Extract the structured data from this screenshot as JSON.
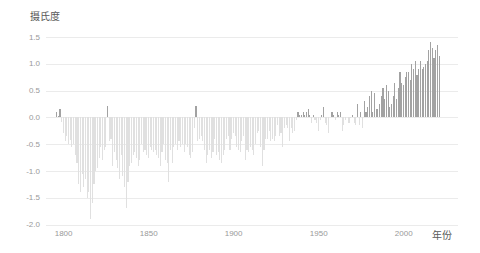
{
  "title": "摄氏度",
  "x_axis_name": "年份",
  "colors": {
    "background": "#ffffff",
    "positive_bar": "#a2a2a2",
    "negative_bar": "#e0e0e0",
    "gridline": "#ebebeb",
    "tick_label": "#999999",
    "axis_title": "#595959"
  },
  "y_axis": {
    "labels": [
      "1.5",
      "1.0",
      "0.5",
      "0.0",
      "-0.5",
      "-1.0",
      "-1.5",
      "-2.0"
    ]
  },
  "chart_data": {
    "type": "bar",
    "title": "摄氏度",
    "xlabel": "年份",
    "ylabel": "摄氏度",
    "legend": false,
    "grid": true,
    "ylim": [
      -2.0,
      1.5
    ],
    "yticks": [
      1.5,
      1.0,
      0.5,
      0.0,
      -0.5,
      -1.0,
      -1.5,
      -2.0
    ],
    "xticks": [
      1800,
      1850,
      1900,
      1950,
      2000
    ],
    "year_start": 1796,
    "year_end": 2021,
    "values": [
      0.11,
      0.03,
      0.16,
      -0.08,
      -0.3,
      -0.45,
      -0.35,
      -0.5,
      -0.42,
      -0.55,
      -0.5,
      -0.7,
      -0.85,
      -1.25,
      -1.4,
      -1.05,
      -1.3,
      -1.15,
      -1.5,
      -1.4,
      -1.9,
      -1.6,
      -1.25,
      -1.0,
      -0.95,
      -0.75,
      -0.55,
      -0.8,
      -0.6,
      -0.55,
      0.22,
      -0.45,
      -0.4,
      -0.9,
      -0.65,
      -0.8,
      -0.95,
      -1.15,
      -0.7,
      -1.1,
      -1.3,
      -1.7,
      -1.2,
      -0.9,
      -0.85,
      -0.7,
      -0.65,
      -0.75,
      -0.9,
      -0.8,
      -0.5,
      -0.65,
      -0.6,
      -0.7,
      -0.75,
      -0.55,
      -0.6,
      -0.65,
      -0.6,
      -0.7,
      -0.75,
      -0.9,
      -0.65,
      -0.5,
      -0.8,
      -0.85,
      -1.2,
      -0.6,
      -0.85,
      -0.55,
      -0.5,
      -0.6,
      -0.45,
      -0.55,
      -0.5,
      -0.65,
      -0.5,
      -0.55,
      -0.7,
      -0.75,
      -0.65,
      -0.2,
      0.22,
      -0.45,
      -0.4,
      -0.35,
      -0.45,
      -0.6,
      -0.85,
      -0.7,
      -0.6,
      -0.75,
      -0.65,
      -0.4,
      -0.7,
      -0.65,
      -0.8,
      -0.85,
      -0.7,
      -0.6,
      -0.4,
      -0.35,
      -0.6,
      -0.4,
      -0.3,
      -0.35,
      -0.55,
      -0.6,
      -0.65,
      -0.45,
      -0.35,
      -0.8,
      -0.6,
      -0.65,
      -0.55,
      -0.6,
      -0.7,
      -0.5,
      -0.3,
      -0.25,
      -0.55,
      -0.9,
      -0.6,
      -0.4,
      -0.4,
      -0.25,
      -0.45,
      -0.4,
      -0.45,
      -0.35,
      -0.15,
      -0.35,
      -0.3,
      -0.55,
      -0.2,
      -0.15,
      -0.2,
      -0.45,
      -0.2,
      -0.3,
      -0.25,
      -0.05,
      0.1,
      0.05,
      0.05,
      0.1,
      0.05,
      0.1,
      0.15,
      0.05,
      -0.1,
      0.05,
      -0.05,
      -0.1,
      -0.25,
      -0.05,
      0.05,
      0.2,
      -0.1,
      -0.15,
      -0.3,
      0.0,
      0.1,
      0.05,
      -0.05,
      0.1,
      0.05,
      0.1,
      -0.25,
      -0.15,
      -0.05,
      0.0,
      -0.1,
      -0.02,
      0.05,
      -0.1,
      -0.15,
      0.25,
      -0.15,
      0.1,
      -0.2,
      0.3,
      0.1,
      0.2,
      0.4,
      0.5,
      0.1,
      0.45,
      0.15,
      0.15,
      0.25,
      0.4,
      0.55,
      0.35,
      0.6,
      0.5,
      0.2,
      0.25,
      0.4,
      0.65,
      0.35,
      0.55,
      0.85,
      0.65,
      0.6,
      0.75,
      0.85,
      0.85,
      0.7,
      1.0,
      0.9,
      1.05,
      0.8,
      0.9,
      1.05,
      0.9,
      0.95,
      1.0,
      1.05,
      1.25,
      1.4,
      1.3,
      1.1,
      1.25,
      1.35,
      1.15
    ]
  }
}
